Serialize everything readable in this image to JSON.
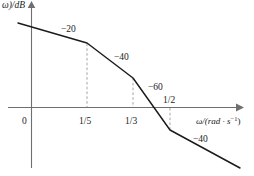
{
  "figure": {
    "title": "",
    "y_axis_label": "ω)/dB",
    "x_axis_label_main": "ω/(rad · s",
    "x_axis_label_exp": "−1",
    "x_axis_label_close": ")",
    "origin_label": "0"
  },
  "ticks": {
    "t1": "1/5",
    "t2": "1/3",
    "t3": "1/2"
  },
  "slopes": {
    "s1": "−20",
    "s2": "−40",
    "s3": "−60",
    "s4": "−40"
  },
  "ghost_text": {
    "lower": "",
    "mid": ""
  },
  "colors": {
    "curve": "#1b1b1b",
    "axis": "#6f6f6f",
    "dashed": "#9a9a9a",
    "background": "#ffffff"
  },
  "chart_data": {
    "type": "line",
    "xlabel": "ω/(rad · s⁻¹)",
    "ylabel": "L(ω)/dB",
    "grid": false,
    "legend": null,
    "x_tick_labels": [
      "0",
      "1/5",
      "1/3",
      "1/2"
    ],
    "x_tick_values": [
      0,
      0.2,
      0.3333,
      0.5
    ],
    "breakpoints": [
      0.2,
      0.3333,
      0.5
    ],
    "segment_slopes_db_per_decade": [
      -20,
      -40,
      -60,
      -40
    ],
    "segment_slope_labels": [
      "−20",
      "−40",
      "−60",
      "−40"
    ],
    "zero_crossing_between": [
      "1/3",
      "1/2"
    ],
    "series": [
      {
        "name": "L(ω)",
        "points_px": [
          [
            18,
            23
          ],
          [
            87,
            43
          ],
          [
            133,
            78
          ],
          [
            170,
            130
          ],
          [
            240,
            168
          ]
        ]
      }
    ]
  }
}
